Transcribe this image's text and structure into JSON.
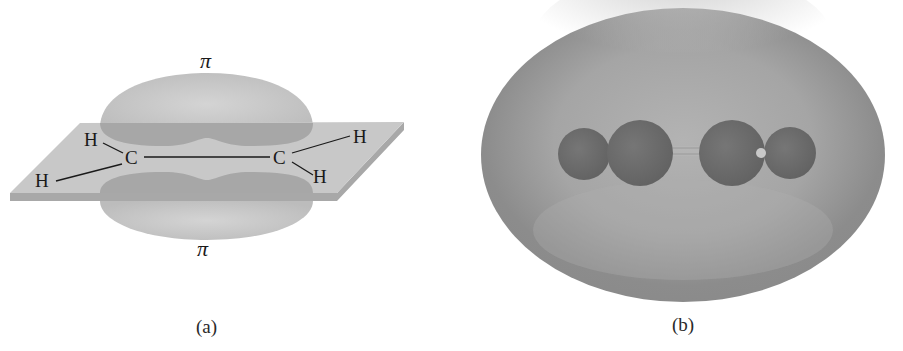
{
  "figure": {
    "panel_a": {
      "caption": "(a)",
      "pi_top_label": "π",
      "pi_bottom_label": "π",
      "atoms": {
        "c_left": "C",
        "c_right": "C",
        "h_top_left": "H",
        "h_bottom_left": "H",
        "h_top_right": "H",
        "h_bottom_right": "H"
      }
    },
    "panel_b": {
      "caption": "(b)"
    },
    "colors": {
      "plane_fill": "#c9c9c9",
      "plane_edge": "#a5a5a5",
      "pi_lobe": "#bdbdbd",
      "pi_lobe_overlap": "#9e9e9e",
      "cloud_fill": "#9a9a9a",
      "atom_fill": "#6e6e6e"
    }
  }
}
